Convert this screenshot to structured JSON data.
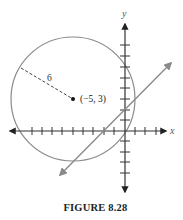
{
  "figure": {
    "caption": "FIGURE 8.28",
    "x_axis_label": "x",
    "y_axis_label": "y",
    "center_label": "(−5, 3)",
    "radius_label": "6"
  },
  "colors": {
    "axis": "#333333",
    "circle": "#8a8a8a",
    "line": "#8a8a8a",
    "dashed_radius": "#444444",
    "center_point": "#111111"
  },
  "geometry": {
    "circle": {
      "center": [
        -5,
        3
      ],
      "radius": 6
    },
    "line": {
      "description": "straight line with arrows at both ends, crossing circle near the y-axis"
    },
    "x_ticks": [
      -11,
      -10,
      -9,
      -8,
      -7,
      -6,
      -5,
      -4,
      -3,
      -2,
      -1,
      1,
      2,
      3
    ],
    "y_ticks": [
      -5,
      -4,
      -3,
      -2,
      -1,
      1,
      2,
      3,
      4,
      5,
      6,
      7,
      8,
      9
    ]
  }
}
